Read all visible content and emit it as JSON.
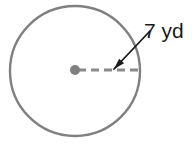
{
  "figure": {
    "type": "geometry-diagram",
    "shape": "circle",
    "background_color": "#ffffff"
  },
  "circle": {
    "name": "circle-outline",
    "center_x": 75,
    "center_y": 71,
    "radius_px": 65,
    "stroke_color": "#808080",
    "stroke_width": 2.4,
    "fill": "none"
  },
  "center_point": {
    "name": "center-dot",
    "x": 75,
    "y": 70,
    "radius_px": 5,
    "color": "#808080"
  },
  "radius_line": {
    "name": "dashed-radius",
    "x1": 78,
    "y1": 70,
    "x2": 140,
    "y2": 70,
    "color": "#8a8a8a",
    "stroke_width": 3,
    "dash_pattern": "8 5"
  },
  "leader_arrow": {
    "name": "leader-arrow",
    "x1": 150,
    "y1": 31,
    "x2": 114,
    "y2": 69,
    "color": "#1a1a1a",
    "stroke_width": 1.8,
    "arrowhead": "at-end"
  },
  "label": {
    "text": "7 yd",
    "value": "7",
    "unit": "yd",
    "x": 144,
    "y": 38,
    "color": "#1a1a1a",
    "font_size_px": 21
  }
}
